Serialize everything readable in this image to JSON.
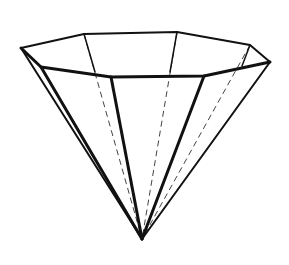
{
  "figure": {
    "title": "Octagonal inverted pyramid (cone-like polyhedron) line drawing",
    "colors": {
      "background": "#ffffff",
      "line": "#111111",
      "hidden_line": "#444444"
    },
    "rim_vertices": [
      {
        "name": "left",
        "x": 21,
        "y": 48
      },
      {
        "name": "back-left",
        "x": 84,
        "y": 34
      },
      {
        "name": "back-right",
        "x": 177,
        "y": 32
      },
      {
        "name": "right-back",
        "x": 250,
        "y": 45
      },
      {
        "name": "right",
        "x": 270,
        "y": 62
      },
      {
        "name": "front-right",
        "x": 204,
        "y": 76
      },
      {
        "name": "front-left",
        "x": 111,
        "y": 77
      },
      {
        "name": "left-front",
        "x": 41,
        "y": 67
      }
    ],
    "apex": {
      "x": 142,
      "y": 239
    }
  }
}
